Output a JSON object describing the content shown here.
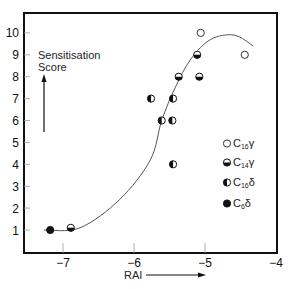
{
  "chart_data": {
    "type": "scatter",
    "title": "",
    "xlabel": "RAI",
    "ylabel": "Sensitisation Score",
    "xlim": [
      -7.55,
      -4.0
    ],
    "ylim": [
      0,
      10.9
    ],
    "x_ticks": [
      -7,
      -6,
      -5,
      -4
    ],
    "y_ticks": [
      1,
      2,
      3,
      4,
      5,
      6,
      7,
      8,
      9,
      10
    ],
    "x_tick_labels": [
      "−7",
      "−6",
      "−5",
      "−4"
    ],
    "y_tick_labels": [
      "1",
      "2",
      "3",
      "4",
      "5",
      "6",
      "7",
      "8",
      "9",
      "10"
    ],
    "grid": false,
    "legend_position": "lower right inside",
    "series": [
      {
        "name": "C16γ",
        "base": "C",
        "sub": "16",
        "suffix": "γ",
        "marker": "open-circle",
        "points": [
          {
            "x": -5.06,
            "y": 10
          },
          {
            "x": -4.44,
            "y": 9
          }
        ]
      },
      {
        "name": "C14γ",
        "base": "C",
        "sub": "14",
        "suffix": "γ",
        "marker": "bottom-half-filled-circle",
        "points": [
          {
            "x": -5.11,
            "y": 9
          },
          {
            "x": -5.37,
            "y": 8
          },
          {
            "x": -5.08,
            "y": 8
          },
          {
            "x": -6.89,
            "y": 1.1
          }
        ]
      },
      {
        "name": "C16δ",
        "base": "C",
        "sub": "16",
        "suffix": "δ",
        "marker": "left-half-filled-circle",
        "points": [
          {
            "x": -5.76,
            "y": 7
          },
          {
            "x": -5.45,
            "y": 7
          },
          {
            "x": -5.61,
            "y": 6
          },
          {
            "x": -5.46,
            "y": 6
          },
          {
            "x": -5.45,
            "y": 4
          }
        ]
      },
      {
        "name": "C6δ",
        "base": "C",
        "sub": "6",
        "suffix": "δ",
        "marker": "filled-circle",
        "points": [
          {
            "x": -7.18,
            "y": 1
          }
        ]
      }
    ],
    "fit_curve": {
      "description": "sigmoidal fit rising then peaking",
      "points": [
        {
          "x": -7.27,
          "y": 1.0
        },
        {
          "x": -6.76,
          "y": 1.1
        },
        {
          "x": -6.2,
          "y": 2.4
        },
        {
          "x": -5.77,
          "y": 4.2
        },
        {
          "x": -5.61,
          "y": 6.0
        },
        {
          "x": -5.42,
          "y": 7.5
        },
        {
          "x": -5.2,
          "y": 8.8
        },
        {
          "x": -4.92,
          "y": 9.7
        },
        {
          "x": -4.59,
          "y": 9.9
        },
        {
          "x": -4.32,
          "y": 9.4
        }
      ]
    },
    "annotations": [
      {
        "text": "Sensitisation",
        "position": "upper left inside"
      },
      {
        "text": "Score",
        "position": "upper left inside"
      },
      {
        "text": "up-arrow",
        "position": "below Score label"
      },
      {
        "text": "right-arrow",
        "position": "after RAI label"
      }
    ]
  },
  "labels": {
    "y_annotation_line1": "Sensitisation",
    "y_annotation_line2": "Score",
    "x_axis_label": "RAI"
  },
  "legend": [
    {
      "base": "C",
      "sub": "16",
      "suffix": "γ"
    },
    {
      "base": "C",
      "sub": "14",
      "suffix": "γ"
    },
    {
      "base": "C",
      "sub": "16",
      "suffix": "δ"
    },
    {
      "base": "C",
      "sub": "6",
      "suffix": "δ"
    }
  ],
  "colors": {
    "ink": "#111111",
    "curve": "#555555",
    "background": "#ffffff"
  }
}
